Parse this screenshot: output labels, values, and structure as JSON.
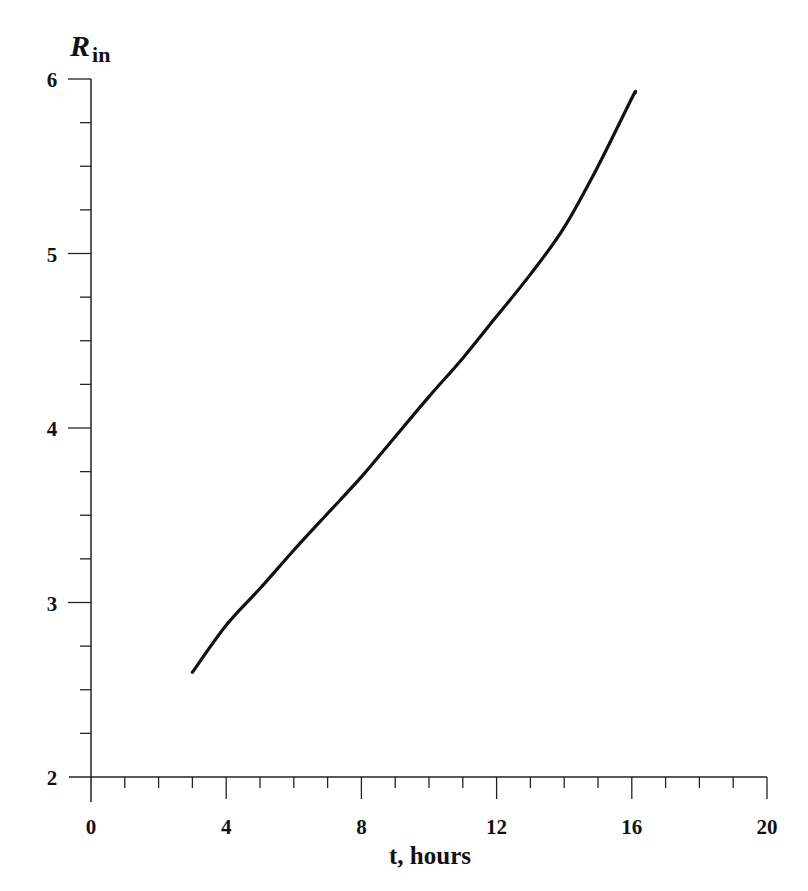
{
  "chart_data": {
    "type": "line",
    "title": "",
    "xlabel": "t, hours",
    "ylabel": "R",
    "ylabel_subscript": "in",
    "xlim": [
      0,
      20
    ],
    "ylim": [
      2,
      6
    ],
    "x_ticks": [
      0,
      4,
      8,
      12,
      16,
      20
    ],
    "x_tick_labels": [
      "0",
      "4",
      "8",
      "12",
      "16",
      "20"
    ],
    "x_minor_step": 1,
    "y_ticks": [
      2,
      3,
      4,
      5,
      6
    ],
    "y_tick_labels": [
      "2",
      "3",
      "4",
      "5",
      "6"
    ],
    "y_minor_step": 0.25,
    "grid": false,
    "legend": null,
    "series": [
      {
        "name": "R_in",
        "color": "#111111",
        "x": [
          3.0,
          4.0,
          5.0,
          6.0,
          7.0,
          8.0,
          9.0,
          10.0,
          11.0,
          12.0,
          13.0,
          14.0,
          15.0,
          16.0,
          16.1
        ],
        "y": [
          2.6,
          2.87,
          3.08,
          3.3,
          3.51,
          3.72,
          3.95,
          4.18,
          4.4,
          4.64,
          4.88,
          5.15,
          5.5,
          5.89,
          5.92
        ]
      }
    ]
  }
}
